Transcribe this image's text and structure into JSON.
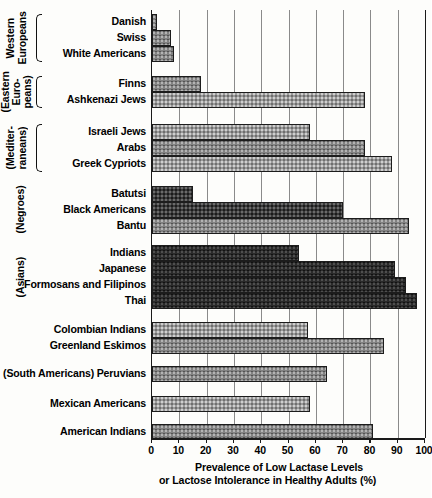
{
  "chart_data": {
    "type": "bar",
    "orientation": "horizontal",
    "title": "",
    "xlabel": "Prevalence of Low Lactase Levels or Lactose Intolerance in Healthy Adults (%)",
    "xlabel_line1": "Prevalence  of  Low  Lactase  Levels",
    "xlabel_line2": "or  Lactose  Intolerance  in  Healthy Adults (%)",
    "ylabel": "",
    "xlim": [
      0,
      100
    ],
    "xticks": [
      0,
      10,
      20,
      30,
      40,
      50,
      60,
      70,
      80,
      90,
      100
    ],
    "xticklabels": [
      "0",
      "10",
      "20",
      "30",
      "40",
      "50",
      "60",
      "70",
      "80",
      "90",
      "100"
    ],
    "grid": true,
    "legend": "none",
    "categories": [
      "Danish",
      "Swiss",
      "White Americans",
      "Finns",
      "Ashkenazi Jews",
      "Israeli Jews",
      "Arabs",
      "Greek Cypriots",
      "Batutsi",
      "Black Americans",
      "Bantu",
      "Indians",
      "Japanese",
      "Formosans and Filipinos",
      "Thai",
      "Colombian Indians",
      "Greenland Eskimos",
      "Peruvians",
      "Mexican Americans",
      "American Indians"
    ],
    "values": [
      2,
      7,
      8,
      18,
      78,
      58,
      78,
      88,
      15,
      70,
      94,
      54,
      89,
      93,
      97,
      57,
      85,
      64,
      58,
      81
    ],
    "groups": [
      {
        "label": "Western\nEuropeans",
        "brace": true,
        "start": 0,
        "end": 2
      },
      {
        "label": "(Eastern\nEuro-\npeans)",
        "brace": true,
        "start": 3,
        "end": 4
      },
      {
        "label": "(Mediter-\nraneans)",
        "brace": true,
        "start": 5,
        "end": 7
      },
      {
        "label": "(Negroes)",
        "brace": false,
        "start": 8,
        "end": 10
      },
      {
        "label": "(Asians)",
        "brace": false,
        "start": 11,
        "end": 14
      },
      {
        "label": "",
        "brace": false,
        "start": 15,
        "end": 16
      },
      {
        "label": "(South Americans)",
        "brace": false,
        "start": 17,
        "end": 17
      },
      {
        "label": "",
        "brace": false,
        "start": 18,
        "end": 18
      },
      {
        "label": "",
        "brace": false,
        "start": 19,
        "end": 19
      }
    ]
  },
  "colors": {
    "axis": "#1a1a1a",
    "grid": "#8a8a8a",
    "bar_light": "#9a9a9a",
    "bar_mid": "#828282",
    "bar_dark": "#3b3b3b",
    "background": "#fdfdfb"
  }
}
